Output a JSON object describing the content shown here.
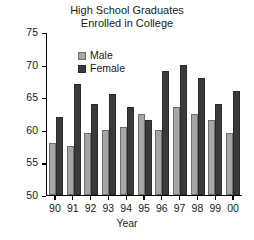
{
  "chart_data": {
    "type": "bar",
    "title": "High School Graduates Enrolled in College",
    "title_lines": [
      "High School Graduates",
      "Enrolled in College"
    ],
    "xlabel": "Year",
    "ylabel": "",
    "categories": [
      "90",
      "91",
      "92",
      "93",
      "94",
      "95",
      "96",
      "97",
      "98",
      "99",
      "00"
    ],
    "series": [
      {
        "name": "Male",
        "color": "#a6a6a6",
        "values": [
          58,
          57.5,
          59.5,
          60,
          60.5,
          62.5,
          60,
          63.5,
          62.5,
          61.5,
          59.5
        ]
      },
      {
        "name": "Female",
        "color": "#3a3a3a",
        "values": [
          62,
          67,
          64,
          65.5,
          63.5,
          61.5,
          69,
          70,
          68,
          64,
          66
        ]
      }
    ],
    "ylim": [
      50,
      75
    ],
    "yticks": [
      50,
      55,
      60,
      65,
      70,
      75
    ],
    "ytick_labels": [
      "50",
      "55",
      "60",
      "65",
      "70",
      "75"
    ],
    "grid": false,
    "legend_position": "upper-left-inside"
  }
}
